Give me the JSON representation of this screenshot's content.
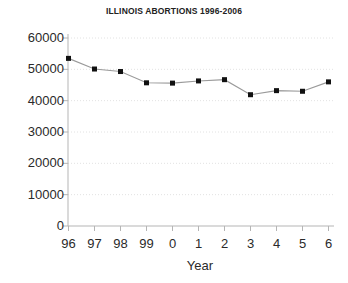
{
  "chart_data": {
    "type": "line",
    "title": "ILLINOIS ABORTIONS 1996-2006",
    "xlabel": "Year",
    "ylabel": "",
    "categories": [
      "96",
      "97",
      "98",
      "99",
      "0",
      "1",
      "2",
      "3",
      "4",
      "5",
      "6"
    ],
    "values": [
      53500,
      50100,
      49300,
      45700,
      45600,
      46300,
      46700,
      41900,
      43200,
      43000,
      46000
    ],
    "ylim": [
      0,
      60000
    ],
    "yticks": [
      0,
      10000,
      20000,
      30000,
      40000,
      50000,
      60000
    ],
    "ytick_labels": [
      "0",
      "10000",
      "20000",
      "30000",
      "40000",
      "50000",
      "60000"
    ],
    "grid": true,
    "grid_style": "dotted",
    "grid_color": "#e2e2e2",
    "legend": "none",
    "marker": "square",
    "marker_color": "#111111",
    "line_color": "#9a9a9a",
    "axis_color": "#b0b0b0"
  }
}
